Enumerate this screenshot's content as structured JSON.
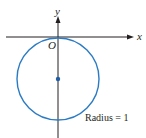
{
  "diagram": {
    "axes": {
      "x_label": "x",
      "y_label": "y",
      "origin_label": "O"
    },
    "circle": {
      "center": [
        0,
        -1
      ],
      "radius": 1,
      "annotation": "Radius = 1",
      "color": "#2b7bc4"
    },
    "colors": {
      "axis": "#231f20",
      "curve": "#2b7bc4",
      "center_dot": "#1f5ea8"
    }
  }
}
